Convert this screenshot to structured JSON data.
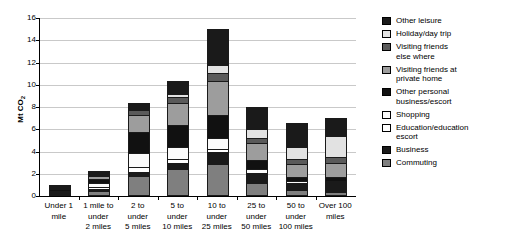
{
  "chart_data": {
    "type": "bar",
    "subtype": "stacked-bar",
    "title": "",
    "xlabel": "",
    "ylabel": "Mt CO2",
    "ylim": [
      0,
      16
    ],
    "yticks": [
      0,
      2,
      4,
      6,
      8,
      10,
      12,
      14,
      16
    ],
    "ytick_labels": [
      "0",
      "2",
      "4",
      "6",
      "8",
      "10",
      "12",
      "14",
      "16"
    ],
    "grid": "horizontal",
    "legend_position": "right",
    "categories": [
      "Under 1 mile",
      "1 mile to under 2 miles",
      "2 to under 5 miles",
      "5 to under 10 miles",
      "10 to under 25 miles",
      "25 to under 50 miles",
      "50 to under 100 miles",
      "Over 100 miles"
    ],
    "category_lines": [
      [
        "Under 1",
        "mile"
      ],
      [
        "1 mile to",
        "under",
        "2 miles"
      ],
      [
        "2 to",
        "under",
        "5 miles"
      ],
      [
        "5 to",
        "under",
        "10 miles"
      ],
      [
        "10 to",
        "under",
        "25 miles"
      ],
      [
        "25 to",
        "under",
        "50 miles"
      ],
      [
        "50 to",
        "under",
        "100 miles"
      ],
      [
        "Over 100",
        "miles"
      ]
    ],
    "series": [
      {
        "name": "Commuting",
        "color": "#7f7f7f",
        "values": [
          0.15,
          0.45,
          1.8,
          2.45,
          2.85,
          1.15,
          0.5,
          0.35
        ]
      },
      {
        "name": "Business",
        "color": "#1a1a1a",
        "values": [
          0.05,
          0.15,
          0.35,
          0.55,
          1.15,
          0.85,
          0.6,
          0.85
        ]
      },
      {
        "name": "Education/education escort",
        "color": "#ffffff",
        "values": [
          0.1,
          0.25,
          0.45,
          0.35,
          0.25,
          0.1,
          0.05,
          0.05
        ]
      },
      {
        "name": "Shopping",
        "color": "#fbfbfb",
        "values": [
          0.12,
          0.35,
          1.3,
          1.1,
          0.95,
          0.35,
          0.15,
          0.1
        ]
      },
      {
        "name": "Other personal business/escort",
        "color": "#111111",
        "values": [
          0.1,
          0.35,
          1.85,
          1.95,
          2.1,
          0.8,
          0.35,
          0.35
        ]
      },
      {
        "name": "Visiting friends at private home",
        "color": "#9d9d9d",
        "values": [
          0.05,
          0.25,
          1.5,
          1.95,
          3.05,
          1.55,
          1.2,
          1.2
        ]
      },
      {
        "name": "Visiting friends else where",
        "color": "#5a5a5a",
        "values": [
          0.03,
          0.1,
          0.45,
          0.55,
          0.7,
          0.45,
          0.45,
          0.55
        ]
      },
      {
        "name": "Holiday/day trip",
        "color": "#e2e2e2",
        "values": [
          0.02,
          0.05,
          0.15,
          0.3,
          0.75,
          0.75,
          1.05,
          1.95
        ]
      },
      {
        "name": "Other leisure",
        "color": "#1a1a1a",
        "values": [
          0.08,
          0.25,
          0.5,
          1.15,
          3.2,
          2.0,
          2.15,
          1.6
        ]
      }
    ],
    "totals": [
      0.7,
      2.2,
      8.35,
      10.35,
      15.0,
      8.0,
      6.5,
      7.0
    ]
  },
  "legend": {
    "items": [
      {
        "label": "Other leisure",
        "color": "#1a1a1a"
      },
      {
        "label": "Holiday/day trip",
        "color": "#e2e2e2"
      },
      {
        "label": "Visiting friends else where",
        "color": "#5a5a5a"
      },
      {
        "label": "Visiting friends at private home",
        "color": "#9d9d9d"
      },
      {
        "label": "Other personal business/escort",
        "color": "#111111"
      },
      {
        "label": "Shopping",
        "color": "#fbfbfb"
      },
      {
        "label": "Education/education escort",
        "color": "#ffffff"
      },
      {
        "label": "Business",
        "color": "#1a1a1a"
      },
      {
        "label": "Commuting",
        "color": "#7f7f7f"
      }
    ],
    "item_lines": [
      [
        "Other leisure"
      ],
      [
        "Holiday/day trip"
      ],
      [
        "Visiting friends",
        "else where"
      ],
      [
        "Visiting friends at",
        "private home"
      ],
      [
        "Other personal",
        "business/escort"
      ],
      [
        "Shopping"
      ],
      [
        "Education/education",
        "escort"
      ],
      [
        "Business"
      ],
      [
        "Commuting"
      ]
    ]
  },
  "axis": {
    "y_title": "Mt CO2"
  }
}
